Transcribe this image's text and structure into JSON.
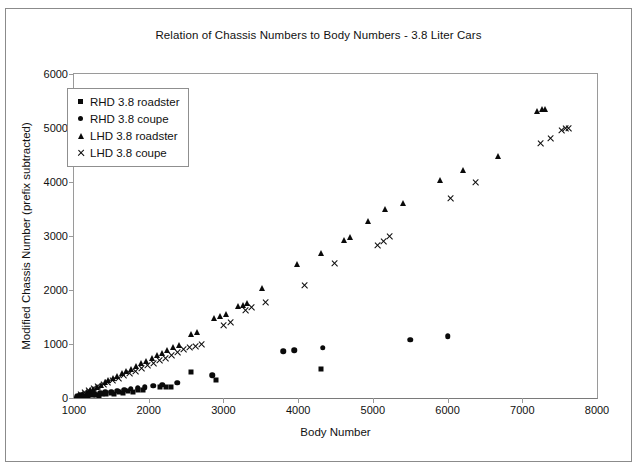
{
  "chart_data": {
    "type": "scatter",
    "title": "Relation of Chassis Numbers to Body Numbers - 3.8 Liter Cars",
    "xlabel": "Body Number",
    "ylabel": "Modified Chassis Number (prefix subtracted)",
    "xlim": [
      1000,
      8000
    ],
    "ylim": [
      0,
      6000
    ],
    "xticks": [
      1000,
      2000,
      3000,
      4000,
      5000,
      6000,
      7000,
      8000
    ],
    "yticks": [
      0,
      1000,
      2000,
      3000,
      4000,
      5000,
      6000
    ],
    "grid": false,
    "legend_position": "top-left",
    "series": [
      {
        "name": "RHD 3.8 roadster",
        "marker": "square",
        "color": "#0a0a0a",
        "points": [
          [
            1040,
            20
          ],
          [
            1075,
            35
          ],
          [
            1110,
            25
          ],
          [
            1150,
            45
          ],
          [
            1190,
            30
          ],
          [
            1240,
            60
          ],
          [
            1290,
            55
          ],
          [
            1330,
            40
          ],
          [
            1380,
            70
          ],
          [
            1430,
            65
          ],
          [
            1490,
            90
          ],
          [
            1540,
            80
          ],
          [
            1600,
            110
          ],
          [
            1660,
            100
          ],
          [
            1720,
            130
          ],
          [
            1790,
            120
          ],
          [
            1860,
            150
          ],
          [
            1930,
            140
          ],
          [
            2150,
            195
          ],
          [
            2230,
            200
          ],
          [
            2300,
            205
          ],
          [
            2560,
            480
          ],
          [
            2900,
            330
          ],
          [
            4300,
            530
          ]
        ]
      },
      {
        "name": "RHD 3.8 coupe",
        "marker": "circle",
        "color": "#0a0a0a",
        "points": [
          [
            1050,
            30
          ],
          [
            1100,
            50
          ],
          [
            1160,
            45
          ],
          [
            1220,
            75
          ],
          [
            1280,
            70
          ],
          [
            1350,
            95
          ],
          [
            1420,
            105
          ],
          [
            1500,
            120
          ],
          [
            1580,
            135
          ],
          [
            1670,
            150
          ],
          [
            1760,
            170
          ],
          [
            1850,
            185
          ],
          [
            1950,
            200
          ],
          [
            2060,
            225
          ],
          [
            2180,
            250
          ],
          [
            2380,
            280
          ],
          [
            2850,
            420
          ],
          [
            3800,
            870
          ],
          [
            3950,
            880
          ],
          [
            4330,
            930
          ],
          [
            5500,
            1080
          ],
          [
            6000,
            1140
          ]
        ]
      },
      {
        "name": "LHD 3.8 roadster",
        "marker": "triangle",
        "color": "#0a0a0a",
        "points": [
          [
            1030,
            40
          ],
          [
            1070,
            60
          ],
          [
            1120,
            80
          ],
          [
            1170,
            110
          ],
          [
            1210,
            140
          ],
          [
            1260,
            175
          ],
          [
            1310,
            210
          ],
          [
            1360,
            250
          ],
          [
            1410,
            290
          ],
          [
            1460,
            330
          ],
          [
            1520,
            375
          ],
          [
            1580,
            415
          ],
          [
            1640,
            460
          ],
          [
            1700,
            500
          ],
          [
            1760,
            545
          ],
          [
            1830,
            590
          ],
          [
            1900,
            640
          ],
          [
            1970,
            690
          ],
          [
            2040,
            740
          ],
          [
            2110,
            790
          ],
          [
            2180,
            840
          ],
          [
            2250,
            890
          ],
          [
            2320,
            940
          ],
          [
            2400,
            990
          ],
          [
            2560,
            1180
          ],
          [
            2640,
            1230
          ],
          [
            2880,
            1480
          ],
          [
            2960,
            1520
          ],
          [
            3040,
            1560
          ],
          [
            3200,
            1700
          ],
          [
            3260,
            1730
          ],
          [
            3320,
            1760
          ],
          [
            3520,
            2040
          ],
          [
            3980,
            2480
          ],
          [
            4300,
            2680
          ],
          [
            4620,
            2930
          ],
          [
            4700,
            2980
          ],
          [
            4940,
            3280
          ],
          [
            5160,
            3500
          ],
          [
            5400,
            3620
          ],
          [
            5900,
            4040
          ],
          [
            6200,
            4220
          ],
          [
            6680,
            4480
          ],
          [
            7200,
            5320
          ],
          [
            7260,
            5350
          ],
          [
            7300,
            5360
          ]
        ]
      },
      {
        "name": "LHD 3.8 coupe",
        "marker": "cross",
        "color": "#0a0a0a",
        "points": [
          [
            1090,
            70
          ],
          [
            1140,
            100
          ],
          [
            1200,
            135
          ],
          [
            1260,
            170
          ],
          [
            1320,
            205
          ],
          [
            1390,
            245
          ],
          [
            1450,
            285
          ],
          [
            1520,
            325
          ],
          [
            1590,
            365
          ],
          [
            1660,
            410
          ],
          [
            1740,
            455
          ],
          [
            1820,
            500
          ],
          [
            1900,
            545
          ],
          [
            1980,
            595
          ],
          [
            2060,
            640
          ],
          [
            2140,
            690
          ],
          [
            2220,
            740
          ],
          [
            2300,
            790
          ],
          [
            2380,
            840
          ],
          [
            2460,
            890
          ],
          [
            2540,
            930
          ],
          [
            2620,
            960
          ],
          [
            2700,
            985
          ],
          [
            3000,
            1340
          ],
          [
            3100,
            1400
          ],
          [
            3300,
            1620
          ],
          [
            3380,
            1680
          ],
          [
            3560,
            1760
          ],
          [
            4080,
            2080
          ],
          [
            4480,
            2490
          ],
          [
            5060,
            2830
          ],
          [
            5140,
            2900
          ],
          [
            5220,
            3000
          ],
          [
            6040,
            3700
          ],
          [
            6380,
            3990
          ],
          [
            7240,
            4720
          ],
          [
            7380,
            4800
          ],
          [
            7520,
            4950
          ],
          [
            7580,
            4990
          ],
          [
            7620,
            5000
          ]
        ]
      }
    ]
  }
}
